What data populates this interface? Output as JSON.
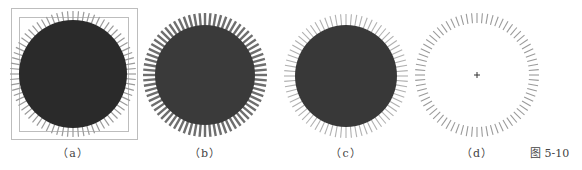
{
  "figure": {
    "caption": "图 5-10",
    "tick_count": 72,
    "panels": [
      {
        "id": "a",
        "label": "（a）",
        "cx": 73,
        "cy": 74,
        "r": 54,
        "tick_inner": 50,
        "tick_outer": 63,
        "tick_color": "#9a9a9a",
        "tick_width": 1.2,
        "fill": "#2a2a2a",
        "has_frame": true,
        "outer_frame": [
          11,
          8,
          126,
          131
        ],
        "inner_frame": [
          19,
          17,
          109,
          114
        ],
        "frame_color": "#bdbdbd"
      },
      {
        "id": "b",
        "label": "（b）",
        "cx": 205,
        "cy": 75,
        "r": 50,
        "tick_inner": 46,
        "tick_outer": 62,
        "tick_color": "#6e6e6e",
        "tick_width": 2.4,
        "fill": "#3a3a3a",
        "has_frame": false
      },
      {
        "id": "c",
        "label": "（c）",
        "cx": 346,
        "cy": 76,
        "r": 51,
        "tick_inner": 48,
        "tick_outer": 62,
        "tick_color": "#b0b0b0",
        "tick_width": 1.1,
        "fill": "#383838",
        "has_frame": false
      },
      {
        "id": "d",
        "label": "（d）",
        "cx": 477,
        "cy": 75,
        "r": 0,
        "tick_inner": 52,
        "tick_outer": 62,
        "tick_color": "#9a9a9a",
        "tick_width": 1.1,
        "fill": "none",
        "has_frame": false,
        "center_mark": "+"
      }
    ]
  }
}
